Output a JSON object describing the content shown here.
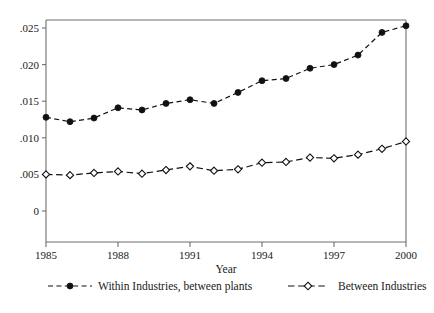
{
  "chart_data": {
    "type": "line",
    "title": "",
    "xlabel": "Year",
    "ylabel": "",
    "x": [
      1985,
      1986,
      1987,
      1988,
      1989,
      1990,
      1991,
      1992,
      1993,
      1994,
      1995,
      1996,
      1997,
      1998,
      1999,
      2000
    ],
    "xlim": [
      1985,
      2000
    ],
    "ylim": [
      0,
      0.0265
    ],
    "grid": false,
    "legend_position": "bottom",
    "x_tick_labels": [
      "1985",
      "1988",
      "1991",
      "1994",
      "1997",
      "2000"
    ],
    "x_tick_values": [
      1985,
      1988,
      1991,
      1994,
      1997,
      2000
    ],
    "y_tick_labels": [
      "0",
      ".005",
      ".010",
      ".015",
      ".020",
      ".025"
    ],
    "y_tick_values": [
      0,
      0.005,
      0.01,
      0.015,
      0.02,
      0.025
    ],
    "series": [
      {
        "name": "Within Industries, between plants",
        "marker": "filled-circle",
        "line_style": "dashed",
        "color": "#111111",
        "values": [
          0.0128,
          0.0122,
          0.0127,
          0.0141,
          0.0138,
          0.0147,
          0.0152,
          0.0147,
          0.0162,
          0.0178,
          0.0181,
          0.0195,
          0.02,
          0.0213,
          0.0244,
          0.0253
        ]
      },
      {
        "name": "Between Industries",
        "marker": "hollow-diamond",
        "line_style": "dashed",
        "color": "#111111",
        "values": [
          0.005,
          0.0049,
          0.0052,
          0.0054,
          0.0051,
          0.0056,
          0.0061,
          0.0055,
          0.0057,
          0.0066,
          0.0067,
          0.0073,
          0.0072,
          0.0077,
          0.0085,
          0.0095
        ]
      }
    ]
  },
  "axes": {
    "x_title": "Year"
  },
  "legend": {
    "items": [
      {
        "label": "Within Industries, between plants",
        "marker": "filled-circle"
      },
      {
        "label": "Between Industries",
        "marker": "hollow-diamond"
      }
    ]
  }
}
